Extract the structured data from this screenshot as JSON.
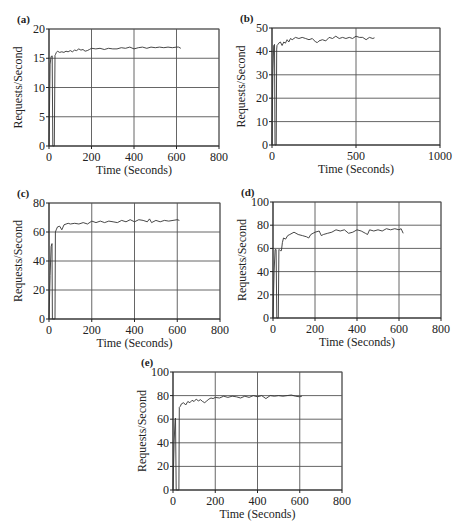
{
  "figure": {
    "background": "#ffffff",
    "line_color": "#333333",
    "grid_color": "#555555"
  },
  "chart_data": [
    {
      "panel": "(a)",
      "type": "line",
      "title": "",
      "xlabel": "Time (Seconds)",
      "ylabel": "Requests/Second",
      "xlim": [
        0,
        800
      ],
      "ylim": [
        0,
        20
      ],
      "xticks": [
        0,
        200,
        400,
        600,
        800
      ],
      "yticks": [
        0,
        5,
        10,
        15,
        20
      ],
      "grid": true,
      "box": {
        "left": 49,
        "top": 29,
        "right": 219,
        "bottom": 146
      },
      "series": [
        {
          "name": "throughput",
          "x": [
            0,
            5,
            10,
            15,
            18,
            20,
            22,
            25,
            28,
            30,
            35,
            40,
            50,
            60,
            70,
            80,
            90,
            100,
            110,
            120,
            130,
            140,
            150,
            160,
            170,
            180,
            190,
            200,
            220,
            240,
            260,
            280,
            300,
            320,
            340,
            360,
            380,
            400,
            420,
            440,
            460,
            480,
            500,
            520,
            540,
            560,
            580,
            600,
            610,
            620
          ],
          "y": [
            0,
            14,
            15.3,
            15.4,
            0,
            0,
            0,
            0,
            15.5,
            15.6,
            16.0,
            16.2,
            16.0,
            16.1,
            16.0,
            16.2,
            16.1,
            16.3,
            16.1,
            16.4,
            16.3,
            16.6,
            16.4,
            16.5,
            16.2,
            16.3,
            16.5,
            16.7,
            16.6,
            16.7,
            16.5,
            16.7,
            16.6,
            16.6,
            16.8,
            16.7,
            16.9,
            16.6,
            16.8,
            16.9,
            16.7,
            16.9,
            16.8,
            16.9,
            16.8,
            16.9,
            16.8,
            16.9,
            16.9,
            16.7
          ]
        }
      ]
    },
    {
      "panel": "(b)",
      "type": "line",
      "title": "",
      "xlabel": "Time (Seconds)",
      "ylabel": "Requests/Second",
      "xlim": [
        0,
        1000
      ],
      "ylim": [
        0,
        50
      ],
      "xticks": [
        0,
        500,
        1000
      ],
      "yticks": [
        0,
        10,
        20,
        30,
        40,
        50
      ],
      "grid": true,
      "box": {
        "left": 272,
        "top": 28,
        "right": 440,
        "bottom": 145
      },
      "series": [
        {
          "name": "throughput",
          "x": [
            0,
            5,
            10,
            15,
            18,
            22,
            25,
            28,
            30,
            35,
            40,
            50,
            60,
            70,
            80,
            90,
            100,
            110,
            120,
            140,
            160,
            180,
            200,
            220,
            240,
            260,
            270,
            280,
            300,
            320,
            340,
            360,
            380,
            400,
            420,
            440,
            460,
            480,
            500,
            520,
            540,
            560,
            580,
            600,
            610
          ],
          "y": [
            0,
            30,
            42.5,
            43,
            0,
            0,
            0,
            41,
            42.5,
            43,
            43.5,
            44,
            42.5,
            44,
            43.5,
            45,
            44,
            45.5,
            45,
            46,
            45.5,
            46,
            45.5,
            45,
            45.5,
            44,
            43.8,
            44.5,
            45,
            44.5,
            46,
            45.5,
            46.5,
            45.5,
            46,
            45.5,
            46,
            45.5,
            46.5,
            46,
            46,
            45,
            46,
            45.5,
            45.8
          ]
        }
      ]
    },
    {
      "panel": "(c)",
      "type": "line",
      "title": "",
      "xlabel": "Time (Seconds)",
      "ylabel": "Requests/Second",
      "xlim": [
        0,
        800
      ],
      "ylim": [
        0,
        80
      ],
      "xticks": [
        0,
        200,
        400,
        600,
        800
      ],
      "yticks": [
        0,
        20,
        40,
        60,
        80
      ],
      "grid": true,
      "box": {
        "left": 49,
        "top": 203,
        "right": 220,
        "bottom": 319
      },
      "series": [
        {
          "name": "throughput",
          "x": [
            0,
            5,
            10,
            14,
            16,
            20,
            25,
            28,
            30,
            35,
            40,
            50,
            60,
            70,
            80,
            90,
            100,
            120,
            140,
            160,
            180,
            200,
            220,
            240,
            260,
            280,
            300,
            320,
            340,
            360,
            380,
            400,
            420,
            440,
            460,
            470,
            480,
            500,
            520,
            540,
            560,
            580,
            600,
            610
          ],
          "y": [
            0,
            30,
            50,
            52,
            0,
            0,
            0,
            0,
            60,
            62,
            63.5,
            64,
            61.5,
            65,
            65.5,
            66,
            65.5,
            66,
            65.5,
            66.5,
            65.5,
            67.5,
            66.5,
            67.5,
            66.5,
            67.5,
            67,
            66.5,
            68,
            67,
            68.5,
            67,
            68.5,
            68,
            67,
            69,
            66.5,
            68,
            67,
            68,
            67.5,
            68,
            68.5,
            68
          ]
        }
      ]
    },
    {
      "panel": "(d)",
      "type": "line",
      "title": "",
      "xlabel": "Time (Seconds)",
      "ylabel": "Requests/Second",
      "xlim": [
        0,
        800
      ],
      "ylim": [
        0,
        100
      ],
      "xticks": [
        0,
        200,
        400,
        600,
        800
      ],
      "yticks": [
        0,
        20,
        40,
        60,
        80,
        100
      ],
      "grid": true,
      "box": {
        "left": 273,
        "top": 202,
        "right": 441,
        "bottom": 318
      },
      "series": [
        {
          "name": "throughput",
          "x": [
            0,
            5,
            10,
            15,
            18,
            22,
            25,
            28,
            30,
            35,
            40,
            45,
            50,
            60,
            70,
            80,
            100,
            120,
            140,
            160,
            170,
            180,
            200,
            220,
            230,
            240,
            260,
            280,
            300,
            320,
            340,
            360,
            380,
            400,
            420,
            440,
            450,
            460,
            480,
            500,
            520,
            540,
            560,
            580,
            600,
            610,
            620
          ],
          "y": [
            0,
            40,
            59,
            59,
            0,
            0,
            0,
            59,
            59,
            58,
            58,
            65,
            69,
            68,
            71,
            72,
            74,
            72,
            71,
            70,
            69,
            72,
            74,
            75,
            71,
            72,
            73,
            74,
            76,
            75,
            76,
            73,
            74,
            76,
            75,
            73,
            72,
            76,
            75,
            76,
            75,
            77,
            76,
            77,
            76,
            77,
            73
          ]
        }
      ]
    },
    {
      "panel": "(e)",
      "type": "line",
      "title": "",
      "xlabel": "Time (Seconds)",
      "ylabel": "Requests/Second",
      "xlim": [
        0,
        800
      ],
      "ylim": [
        0,
        100
      ],
      "xticks": [
        0,
        200,
        400,
        600,
        800
      ],
      "yticks": [
        0,
        20,
        40,
        60,
        80,
        100
      ],
      "grid": true,
      "box": {
        "left": 173,
        "top": 372,
        "right": 342,
        "bottom": 490
      },
      "series": [
        {
          "name": "throughput",
          "x": [
            0,
            5,
            10,
            12,
            15,
            20,
            25,
            28,
            30,
            35,
            40,
            50,
            60,
            70,
            80,
            90,
            100,
            110,
            120,
            130,
            140,
            150,
            160,
            170,
            180,
            190,
            200,
            220,
            240,
            260,
            280,
            300,
            320,
            340,
            360,
            380,
            400,
            420,
            440,
            460,
            480,
            500,
            520,
            540,
            560,
            580,
            600,
            610
          ],
          "y": [
            0,
            40,
            60,
            61,
            0,
            0,
            0,
            0,
            70,
            71,
            73,
            74,
            72,
            75,
            74,
            76,
            75,
            77,
            75.5,
            76.5,
            75,
            74,
            75.5,
            77,
            78,
            77.5,
            78.5,
            78,
            79.5,
            78.5,
            79.5,
            79,
            78,
            79.5,
            78.5,
            80,
            79,
            80,
            77.5,
            80,
            79.5,
            80,
            79.5,
            80,
            80.5,
            79.5,
            79,
            79.5
          ]
        }
      ]
    }
  ]
}
